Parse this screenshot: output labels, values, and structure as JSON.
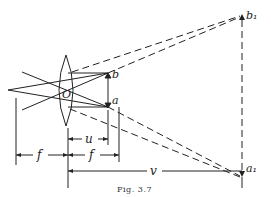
{
  "figure": {
    "caption": "Fig. 3.7",
    "labels": {
      "center": "O",
      "object_top": "b",
      "object_bottom": "a",
      "image_top": "b₁",
      "image_bottom": "a₁",
      "object_distance": "u",
      "focal_left": "f",
      "focal_right": "f",
      "image_distance": "v"
    },
    "elements": [
      "converging-lens",
      "object-arrow",
      "virtual-image-arrow",
      "principal-rays",
      "dashed-extension-rays",
      "dimension-lines"
    ]
  }
}
